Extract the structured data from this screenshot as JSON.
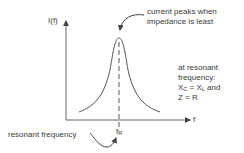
{
  "diagram": {
    "y_axis_label": "I(f)",
    "x_axis_label": "f",
    "marker_label": "f",
    "marker_subscript": "R",
    "annotations": {
      "peak": {
        "line1": "current peaks when",
        "line2": "impedance is least"
      },
      "condition": {
        "line1": "at resonant",
        "line2": "frequency:",
        "line3_a": "X",
        "line3_a_sub": "C",
        "line3_eq": " = X",
        "line3_b_sub": "L",
        "line3_end": " and",
        "line4": "Z = R"
      },
      "resonant_frequency": "resonant frequency"
    },
    "colors": {
      "line": "#555555",
      "text": "#3a3a3a"
    }
  }
}
